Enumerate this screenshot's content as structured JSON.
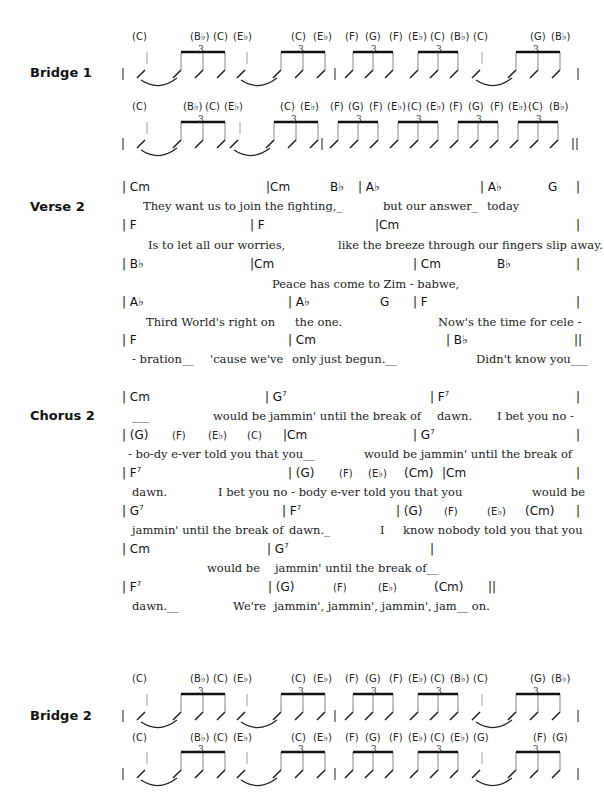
{
  "sections": {
    "bridge1": {
      "label": "Bridge 1",
      "row1": {
        "chords": [
          "(C)",
          "(B♭)",
          "(C)",
          "(E♭)",
          "(C)",
          "(E♭)",
          "(F)",
          "(G)",
          "(F)",
          "(E♭)",
          "(C)",
          "(B♭)",
          "(C)",
          "(G)",
          "(B♭)"
        ],
        "end_bar": "|"
      },
      "row2": {
        "chords": [
          "(C)",
          "(B♭)",
          "(C)",
          "(E♭)",
          "(C)",
          "(E♭)",
          "(F)",
          "(G)",
          "(F)",
          "(E♭)",
          "(C)",
          "(E♭)",
          "(F)",
          "(G)",
          "(F)",
          "(E♭)",
          "(C)",
          "(B♭)"
        ],
        "end_bar": "||"
      },
      "tuplet": "3"
    },
    "verse2": {
      "label": "Verse 2",
      "lines": [
        {
          "chords": [
            "| Cm",
            "|Cm",
            "B♭",
            "| A♭",
            "| A♭",
            "G",
            "|"
          ],
          "lyrics": [
            "They want us to join the  fighting,_",
            "but our answer_",
            "today"
          ]
        },
        {
          "chords": [
            "|  F",
            "|  F",
            "|Cm",
            "|"
          ],
          "lyrics": [
            "Is  to  let  all  our  worries,",
            "like the  breeze through our fingers slip away."
          ]
        },
        {
          "chords": [
            "|  B♭",
            "|Cm",
            "| Cm",
            "B♭",
            "|"
          ],
          "lyrics": [
            "Peace  has  come  to  Zim   -   babwe,"
          ]
        },
        {
          "chords": [
            "|  A♭",
            "| A♭",
            "G",
            "|  F",
            "|"
          ],
          "lyrics": [
            "Third  World's  right  on",
            "the one.",
            "Now's the time for cele -"
          ]
        },
        {
          "chords": [
            "|  F",
            "| Cm",
            "|  B♭",
            "||"
          ],
          "lyrics": [
            "- bration__",
            "'cause we've",
            "only   just   begun.__",
            "Didn't know you___"
          ]
        }
      ]
    },
    "chorus2": {
      "label": "Chorus 2",
      "lines": [
        {
          "chords": [
            "| Cm",
            "| G7",
            "| F7",
            "|"
          ],
          "lyrics": [
            "___",
            "would be   jammin' until the break of",
            "dawn.",
            "I bet you no -"
          ]
        },
        {
          "chords": [
            "| (G)",
            "(F)",
            "(E♭)",
            "(C)",
            "|Cm",
            "| G7",
            "|"
          ],
          "lyrics": [
            "- bo-dy e-ver told you that you__",
            "would be  jammin' until the break of"
          ]
        },
        {
          "chords": [
            "|  F7",
            "| (G)",
            "(F)",
            "(E♭)",
            "(Cm)",
            "|Cm",
            "|"
          ],
          "lyrics": [
            "dawn.",
            "I bet you no  -  body e-ver told you that you",
            "would be"
          ]
        },
        {
          "chords": [
            "|  G7",
            "| F7",
            "| (G)",
            "(F)",
            "(E♭)",
            "(Cm)",
            "|"
          ],
          "lyrics": [
            "jammin' until the break of",
            "dawn._",
            "I",
            "know nobody told you that you"
          ]
        },
        {
          "chords": [
            "| Cm",
            "| G7",
            "|"
          ],
          "lyrics": [
            "would  be",
            "jammin'  until  the  break  of__"
          ]
        },
        {
          "chords": [
            "|  F7",
            "| (G)",
            "(F)",
            "(E♭)",
            "(Cm)",
            "||"
          ],
          "lyrics": [
            "dawn.__",
            "We're",
            "jammin',  jammin',  jammin', jam__ on."
          ]
        }
      ]
    },
    "bridge2": {
      "label": "Bridge 2",
      "row1": {
        "chords": [
          "(C)",
          "(B♭)",
          "(C)",
          "(E♭)",
          "(C)",
          "(E♭)",
          "(F)",
          "(G)",
          "(F)",
          "(E♭)",
          "(C)",
          "(B♭)",
          "(C)",
          "(G)",
          "(B♭)"
        ],
        "end_bar": "|"
      },
      "row2": {
        "chords": [
          "(C)",
          "(B♭)",
          "(C)",
          "(E♭)",
          "(C)",
          "(E♭)",
          "(F)",
          "(G)",
          "(F)",
          "(E♭)",
          "(C)",
          "(E♭)",
          "(G)",
          "(F)",
          "(G)"
        ],
        "end_bar": "|"
      },
      "tuplet": "3"
    }
  }
}
